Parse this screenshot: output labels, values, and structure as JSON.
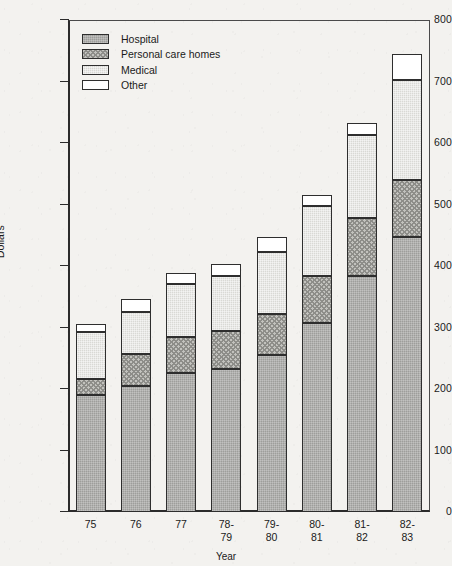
{
  "chart_data": {
    "type": "bar",
    "subtype": "stacked-bar",
    "title": "",
    "xlabel": "Year",
    "ylabel": "Dollars",
    "ylim": [
      0,
      800
    ],
    "ytick_step": 100,
    "yticks": [
      0,
      100,
      200,
      300,
      400,
      500,
      600,
      700,
      800
    ],
    "ytick_labels": [
      "0",
      "100",
      "200",
      "300",
      "400",
      "500",
      "600",
      "700",
      "800"
    ],
    "grid": false,
    "legend_position": "top-left-inside",
    "categories": [
      "75",
      "76",
      "77",
      "78-\n79",
      "79-\n80",
      "80-\n81",
      "81-\n82",
      "82-\n83"
    ],
    "category_labels_flat": [
      "75",
      "76",
      "77",
      "78-79",
      "79-80",
      "80-81",
      "81-82",
      "82-83"
    ],
    "series": [
      {
        "name": "Hospital",
        "pattern": "solid-gray",
        "color": "#9e9e9b",
        "values": [
          190,
          205,
          226,
          232,
          255,
          307,
          384,
          447
        ]
      },
      {
        "name": "Personal care homes",
        "pattern": "crosshatch",
        "color": "#c2c2be",
        "values": [
          27,
          52,
          59,
          63,
          67,
          76,
          94,
          93
        ]
      },
      {
        "name": "Medical",
        "pattern": "light-stipple",
        "color": "#d9d9d5",
        "values": [
          76,
          68,
          86,
          89,
          101,
          114,
          135,
          163
        ]
      },
      {
        "name": "Other",
        "pattern": "white",
        "color": "#ffffff",
        "values": [
          13,
          21,
          18,
          20,
          24,
          18,
          20,
          41
        ]
      }
    ],
    "totals": [
      306,
      346,
      389,
      404,
      447,
      515,
      633,
      744
    ]
  },
  "legend": {
    "items": [
      {
        "label": "Hospital"
      },
      {
        "label": "Personal care homes"
      },
      {
        "label": "Medical"
      },
      {
        "label": "Other"
      }
    ]
  },
  "axes": {
    "y_title": "Dollars",
    "x_title": "Year"
  }
}
